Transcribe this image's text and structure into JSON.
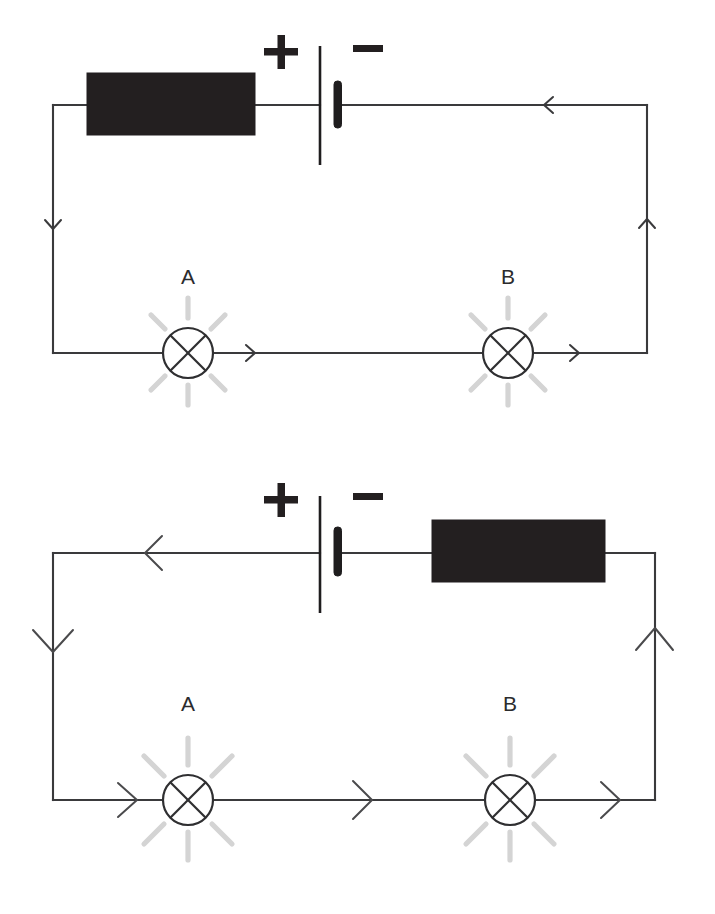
{
  "page": {
    "background_color": "#ffffff",
    "width": 715,
    "height": 914
  },
  "colors": {
    "wire": "#3a3a3c",
    "component_fill": "#231f20",
    "lamp_outline": "#2f2f31",
    "glow_ray": "#d4d4d4",
    "label_text": "#2b2b2d"
  },
  "circuits": [
    {
      "id": "circuit-top",
      "name": "upper-circuit",
      "battery": {
        "positive_label": "+",
        "negative_label": "−",
        "positive_terminal_side": "left",
        "negative_terminal_side": "right"
      },
      "component_box": {
        "name": "resistor-block",
        "position": "left-of-battery",
        "label": ""
      },
      "lamps": [
        {
          "label": "A",
          "position": "bottom-left",
          "glowing": true
        },
        {
          "label": "B",
          "position": "bottom-right",
          "glowing": true
        }
      ],
      "current_direction": "counterclockwise",
      "arrow_count": 4,
      "arrow_size": "small"
    },
    {
      "id": "circuit-bottom",
      "name": "lower-circuit",
      "battery": {
        "positive_label": "+",
        "negative_label": "−",
        "positive_terminal_side": "left",
        "negative_terminal_side": "right"
      },
      "component_box": {
        "name": "resistor-block",
        "position": "right-of-battery",
        "label": ""
      },
      "lamps": [
        {
          "label": "A",
          "position": "bottom-left",
          "glowing": true
        },
        {
          "label": "B",
          "position": "bottom-right",
          "glowing": true
        }
      ],
      "current_direction": "counterclockwise",
      "arrow_count": 6,
      "arrow_size": "large"
    }
  ],
  "labels": {
    "top_plus": "+",
    "top_minus": "−",
    "top_lamp_a": "A",
    "top_lamp_b": "B",
    "bottom_plus": "+",
    "bottom_minus": "−",
    "bottom_lamp_a": "A",
    "bottom_lamp_b": "B"
  }
}
